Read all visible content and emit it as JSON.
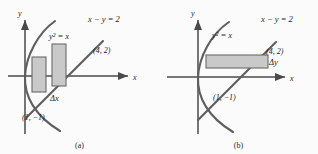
{
  "figure": {
    "panels": [
      {
        "id": "a",
        "caption": "(a)",
        "axis_x_label": "x",
        "axis_y_label": "y",
        "curve_label": "y² = x",
        "line_label": "x − y = 2",
        "point_upper_label": "(4, 2)",
        "point_lower_label": "(1, −1)",
        "element_label": "Δx",
        "strip_orientation": "vertical",
        "strip_count": 2
      },
      {
        "id": "b",
        "caption": "(b)",
        "axis_x_label": "x",
        "axis_y_label": "y",
        "curve_label": "y² = x",
        "line_label": "x − y = 2",
        "point_upper_label": "(4, 2)",
        "point_lower_label": "(1, −1)",
        "element_label": "Δy",
        "strip_orientation": "horizontal",
        "strip_count": 1
      }
    ],
    "colors": {
      "background": "#fbfbfb",
      "curve": "#5e5e5e",
      "axis": "#4a4a4a",
      "strip_fill": "#c9c9c9",
      "strip_stroke": "#6a6a6a",
      "text": "#1d1d1d"
    }
  }
}
